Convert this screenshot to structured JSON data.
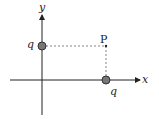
{
  "diagram": {
    "axes": {
      "x_label": "x",
      "y_label": "y"
    },
    "point": {
      "label": "P"
    },
    "charges": [
      {
        "label": "q",
        "position": "on y-axis"
      },
      {
        "label": "q",
        "position": "on x-axis"
      }
    ],
    "colors": {
      "axis": "#222222",
      "charge_fill": "#777777",
      "charge_stroke": "#333333",
      "dashed": "#666666"
    }
  }
}
